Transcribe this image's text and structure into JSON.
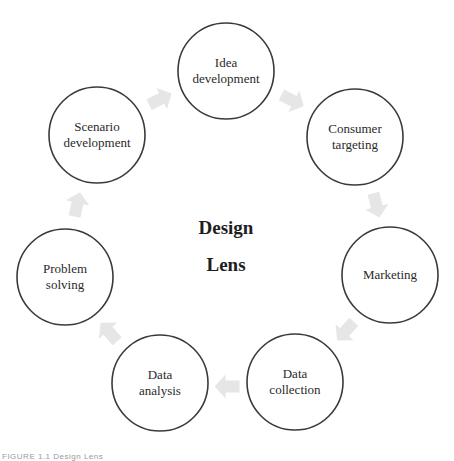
{
  "diagram": {
    "title_lines": [
      "Design",
      "Lens"
    ],
    "nodes": [
      {
        "id": "idea-development",
        "lines": [
          "Idea",
          "development"
        ]
      },
      {
        "id": "consumer-targeting",
        "lines": [
          "Consumer",
          "targeting"
        ]
      },
      {
        "id": "marketing",
        "lines": [
          "Marketing"
        ]
      },
      {
        "id": "data-collection",
        "lines": [
          "Data",
          "collection"
        ]
      },
      {
        "id": "data-analysis",
        "lines": [
          "Data",
          "analysis"
        ]
      },
      {
        "id": "problem-solving",
        "lines": [
          "Problem",
          "solving"
        ]
      },
      {
        "id": "scenario-development",
        "lines": [
          "Scenario",
          "development"
        ]
      }
    ],
    "flow": "clockwise",
    "colors": {
      "circle_stroke": "#3a3a3a",
      "arrow_fill": "#e6e6e6",
      "text": "#2a2a2a"
    }
  },
  "caption": "FIGURE 1.1  Design Lens"
}
